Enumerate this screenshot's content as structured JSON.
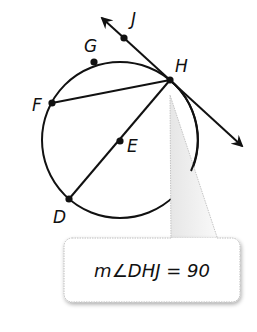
{
  "figure": {
    "type": "circle-geometry",
    "circle": {
      "center_label": "E",
      "cx": 120,
      "cy": 140,
      "r": 78
    },
    "points": [
      {
        "name": "J",
        "label": "J",
        "x": 124,
        "y": 38,
        "lx": 131,
        "ly": 25
      },
      {
        "name": "G",
        "label": "G",
        "x": 94,
        "y": 62,
        "lx": 85,
        "ly": 52
      },
      {
        "name": "H",
        "label": "H",
        "x": 170,
        "y": 80,
        "lx": 175,
        "ly": 72
      },
      {
        "name": "F",
        "label": "F",
        "x": 52,
        "y": 103,
        "lx": 32,
        "ly": 110
      },
      {
        "name": "E",
        "label": "E",
        "x": 120,
        "y": 141,
        "lx": 127,
        "ly": 152
      },
      {
        "name": "D",
        "label": "D",
        "x": 69,
        "y": 199,
        "lx": 53,
        "ly": 222
      }
    ],
    "segments": [
      {
        "name": "chord-FH",
        "from": "F",
        "to": "H"
      },
      {
        "name": "diameter-DH",
        "from": "D",
        "to": "H"
      }
    ],
    "tangent_line": {
      "name": "tangent-JH",
      "through": [
        "J",
        "H"
      ],
      "arrow_start": {
        "x": 102,
        "y": 18
      },
      "arrow_end": {
        "x": 242,
        "y": 146
      }
    },
    "callout": {
      "text": "m∠DHJ = 90",
      "box": {
        "x": 64,
        "y": 238,
        "width": 176,
        "height": 64,
        "rx": 8
      },
      "pointer_tip": {
        "x": 170,
        "y": 95
      },
      "colors": {
        "fill": "#ffffff",
        "stroke": "#b8b8b8",
        "shadow": "#c8c8c8"
      }
    },
    "colors": {
      "stroke": "#111111",
      "point": "#111111"
    }
  }
}
